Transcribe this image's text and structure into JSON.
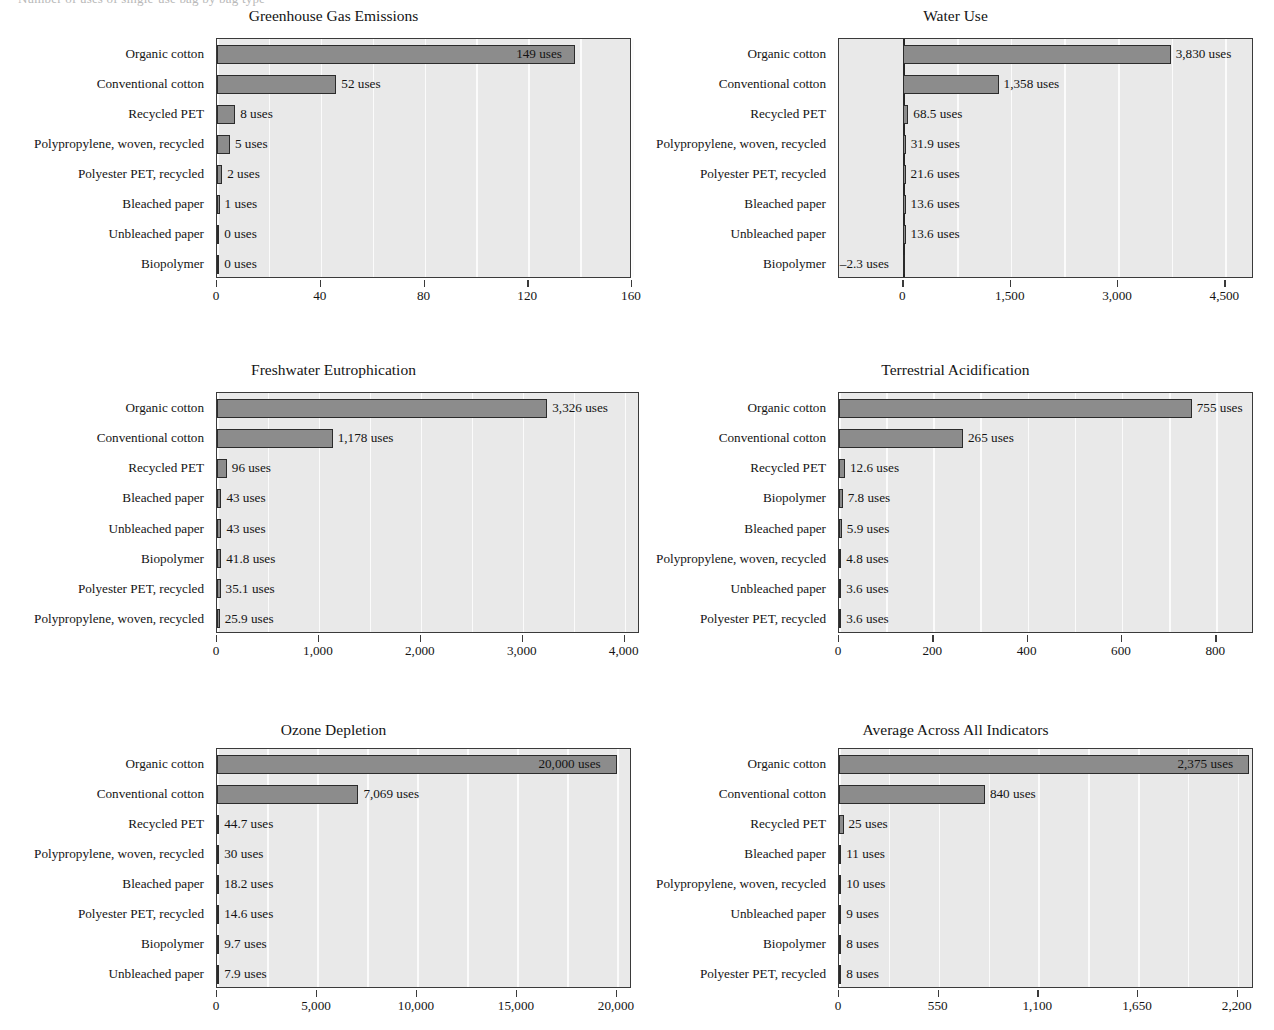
{
  "cropped_heading_text": "Number of uses of single-use bag by bag type",
  "colors": {
    "bar_fill": "#8c8c8c",
    "bar_stroke": "#2b2b2b",
    "plot_background": "#e9e9e9",
    "gridline": "#fbfbfb",
    "axis": "#3a3a3a",
    "text": "#141414"
  },
  "unit_suffix": "uses",
  "chart_data": [
    {
      "type": "bar",
      "orientation": "horizontal",
      "title": "Greenhouse Gas Emissions",
      "xlabel": "",
      "ylabel": "",
      "xlim": [
        0,
        160
      ],
      "ticks": [
        0,
        40,
        80,
        120,
        160
      ],
      "tick_labels": [
        "0",
        "40",
        "80",
        "120",
        "160"
      ],
      "grid": true,
      "legend": "none",
      "categories": [
        "Organic cotton",
        "Conventional cotton",
        "Recycled PET",
        "Polypropylene, woven, recycled",
        "Polyester PET, recycled",
        "Bleached paper",
        "Unbleached paper",
        "Biopolymer"
      ],
      "values": [
        149,
        52,
        8,
        5,
        2,
        1,
        0,
        0
      ],
      "bar_lengths": [
        138,
        46,
        7,
        5,
        2,
        1,
        0.3,
        0.3
      ],
      "data_labels": [
        "149 uses",
        "52 uses",
        "8 uses",
        "5 uses",
        "2 uses",
        "1 uses",
        "0 uses",
        "0 uses"
      ]
    },
    {
      "type": "bar",
      "orientation": "horizontal",
      "title": "Water Use",
      "xlabel": "",
      "ylabel": "",
      "xlim": [
        -900,
        4900
      ],
      "ticks": [
        0,
        1500,
        3000,
        4500
      ],
      "tick_labels": [
        "0",
        "1,500",
        "3,000",
        "4,500"
      ],
      "grid": true,
      "legend": "none",
      "categories": [
        "Organic cotton",
        "Conventional cotton",
        "Recycled PET",
        "Polypropylene, woven, recycled",
        "Polyester PET, recycled",
        "Bleached paper",
        "Unbleached paper",
        "Biopolymer"
      ],
      "values": [
        3830,
        1358,
        68.5,
        31.9,
        21.6,
        13.6,
        13.6,
        -2.3
      ],
      "bar_lengths": [
        3735,
        1330,
        68.5,
        31.9,
        21.6,
        13.6,
        13.6,
        -2.3
      ],
      "data_labels": [
        "3,830 uses",
        "1,358 uses",
        "68.5 uses",
        "31.9 uses",
        "21.6 uses",
        "13.6 uses",
        "13.6 uses",
        "–2.3 uses"
      ]
    },
    {
      "type": "bar",
      "orientation": "horizontal",
      "title": "Freshwater Eutrophication",
      "xlabel": "",
      "ylabel": "",
      "xlim": [
        0,
        4150
      ],
      "ticks": [
        0,
        1000,
        2000,
        3000,
        4000
      ],
      "tick_labels": [
        "0",
        "1,000",
        "2,000",
        "3,000",
        "4,000"
      ],
      "grid": true,
      "legend": "none",
      "categories": [
        "Organic cotton",
        "Conventional cotton",
        "Recycled PET",
        "Bleached paper",
        "Unbleached paper",
        "Biopolymer",
        "Polyester PET, recycled",
        "Polypropylene, woven, recycled"
      ],
      "values": [
        3326,
        1178,
        96,
        43,
        43,
        41.8,
        35.1,
        25.9
      ],
      "bar_lengths": [
        3240,
        1135,
        96,
        43,
        43,
        41.8,
        35.1,
        25.9
      ],
      "data_labels": [
        "3,326 uses",
        "1,178 uses",
        "96 uses",
        "43 uses",
        "43 uses",
        "41.8 uses",
        "35.1 uses",
        "25.9 uses"
      ]
    },
    {
      "type": "bar",
      "orientation": "horizontal",
      "title": "Terrestrial Acidification",
      "xlabel": "",
      "ylabel": "",
      "xlim": [
        0,
        880
      ],
      "ticks": [
        0,
        200,
        400,
        600,
        800
      ],
      "tick_labels": [
        "0",
        "200",
        "400",
        "600",
        "800"
      ],
      "grid": true,
      "legend": "none",
      "categories": [
        "Organic cotton",
        "Conventional cotton",
        "Recycled PET",
        "Biopolymer",
        "Bleached paper",
        "Polypropylene, woven, recycled",
        "Unbleached paper",
        "Polyester PET, recycled"
      ],
      "values": [
        755,
        265,
        12.6,
        7.8,
        5.9,
        4.8,
        3.6,
        3.6
      ],
      "bar_lengths": [
        748,
        263,
        12.6,
        7.8,
        5.9,
        4.8,
        3.6,
        3.6
      ],
      "data_labels": [
        "755 uses",
        "265 uses",
        "12.6 uses",
        "7.8 uses",
        "5.9 uses",
        "4.8 uses",
        "3.6 uses",
        "3.6 uses"
      ]
    },
    {
      "type": "bar",
      "orientation": "horizontal",
      "title": "Ozone Depletion",
      "xlabel": "",
      "ylabel": "",
      "xlim": [
        0,
        20750
      ],
      "ticks": [
        0,
        5000,
        10000,
        15000,
        20000
      ],
      "tick_labels": [
        "0",
        "5,000",
        "10,000",
        "15,000",
        "20,000"
      ],
      "grid": true,
      "legend": "none",
      "categories": [
        "Organic cotton",
        "Conventional cotton",
        "Recycled PET",
        "Polypropylene, woven, recycled",
        "Bleached paper",
        "Polyester PET, recycled",
        "Biopolymer",
        "Unbleached paper"
      ],
      "values": [
        20000,
        7069,
        44.7,
        30,
        18.2,
        14.6,
        9.7,
        7.9
      ],
      "bar_lengths": [
        20000,
        7069,
        44.7,
        30,
        18.2,
        14.6,
        9.7,
        7.9
      ],
      "data_labels": [
        "20,000 uses",
        "7,069 uses",
        "44.7 uses",
        "30 uses",
        "18.2 uses",
        "14.6 uses",
        "9.7 uses",
        "7.9 uses"
      ]
    },
    {
      "type": "bar",
      "orientation": "horizontal",
      "title": "Average Across All Indicators",
      "xlabel": "",
      "ylabel": "",
      "xlim": [
        0,
        2290
      ],
      "ticks": [
        0,
        550,
        1100,
        1650,
        2200
      ],
      "tick_labels": [
        "0",
        "550",
        "1,100",
        "1,650",
        "2,200"
      ],
      "grid": true,
      "legend": "none",
      "categories": [
        "Organic cotton",
        "Conventional cotton",
        "Recycled PET",
        "Bleached paper",
        "Polypropylene, woven, recycled",
        "Unbleached paper",
        "Biopolymer",
        "Polyester PET, recycled"
      ],
      "values": [
        2375,
        840,
        25,
        11,
        10,
        9,
        8,
        8
      ],
      "bar_lengths": [
        2265,
        805,
        25,
        11,
        10,
        9,
        8,
        8
      ],
      "data_labels": [
        "2,375 uses",
        "840 uses",
        "25 uses",
        "11 uses",
        "10 uses",
        "9 uses",
        "8 uses",
        "8 uses"
      ]
    }
  ]
}
